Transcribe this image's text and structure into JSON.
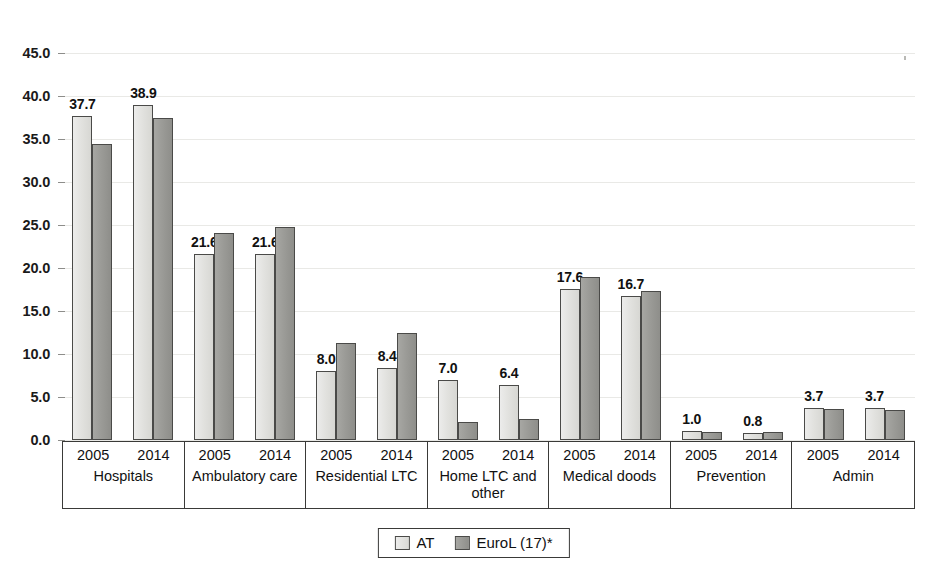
{
  "chart_data": {
    "type": "bar",
    "title": "",
    "xlabel": "",
    "ylabel": "",
    "ylim": [
      0.0,
      45.0
    ],
    "ytick_labels": [
      "0.0",
      "5.0",
      "10.0",
      "15.0",
      "20.0",
      "25.0",
      "30.0",
      "35.0",
      "40.0",
      "45.0"
    ],
    "ytick_values": [
      0.0,
      5.0,
      10.0,
      15.0,
      20.0,
      25.0,
      30.0,
      35.0,
      40.0,
      45.0
    ],
    "grid": true,
    "legend_position": "bottom-center",
    "series": [
      {
        "name": "AT",
        "color": "#e2e2df",
        "values": [
          37.7,
          38.9,
          21.6,
          21.6,
          8.0,
          8.4,
          7.0,
          6.4,
          17.6,
          16.7,
          1.0,
          0.8,
          3.7,
          3.7
        ],
        "labels": [
          "37.7",
          "38.9",
          "21.6",
          "21.6",
          "8.0",
          "8.4",
          "7.0",
          "6.4",
          "17.6",
          "16.7",
          "1.0",
          "0.8",
          "3.7",
          "3.7"
        ]
      },
      {
        "name": "EuroL (17)*",
        "color": "#9b9b97",
        "values": [
          34.4,
          37.5,
          24.1,
          24.8,
          11.3,
          12.5,
          2.1,
          2.4,
          19.0,
          17.3,
          0.9,
          0.9,
          3.6,
          3.5
        ],
        "labels": [
          "",
          "",
          "",
          "",
          "",
          "",
          "",
          "",
          "",
          "",
          "",
          "",
          "",
          ""
        ]
      }
    ],
    "categories": [
      "2005",
      "2014",
      "2005",
      "2014",
      "2005",
      "2014",
      "2005",
      "2014",
      "2005",
      "2014",
      "2005",
      "2014",
      "2005",
      "2014"
    ],
    "groups": [
      {
        "name": "Hospitals",
        "years": [
          "2005",
          "2014"
        ]
      },
      {
        "name": "Ambulatory care",
        "years": [
          "2005",
          "2014"
        ]
      },
      {
        "name": "Residential LTC",
        "years": [
          "2005",
          "2014"
        ]
      },
      {
        "name": "Home LTC and other",
        "years": [
          "2005",
          "2014"
        ]
      },
      {
        "name": "Medical doods",
        "years": [
          "2005",
          "2014"
        ]
      },
      {
        "name": "Prevention",
        "years": [
          "2005",
          "2014"
        ]
      },
      {
        "name": "Admin",
        "years": [
          "2005",
          "2014"
        ]
      }
    ]
  },
  "legend": {
    "items": [
      {
        "label": "AT",
        "swatch": "light-gray-swatch"
      },
      {
        "label": "EuroL (17)*",
        "swatch": "dark-gray-swatch"
      }
    ]
  }
}
